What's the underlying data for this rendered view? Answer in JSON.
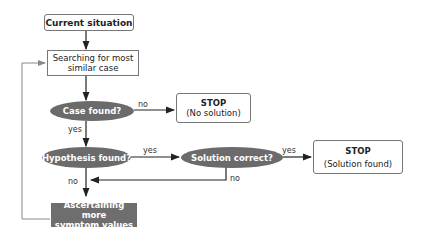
{
  "diagram": {
    "nodes": {
      "start": {
        "label": "Current situation"
      },
      "search": {
        "line1": "Searching for most",
        "line2": "similar case"
      },
      "case_found": {
        "label": "Case found?"
      },
      "stop_no_solution": {
        "title": "STOP",
        "subtitle": "(No solution)"
      },
      "hypothesis_found": {
        "label": "Hypothesis found?"
      },
      "solution_correct": {
        "label": "Solution correct?"
      },
      "stop_solution_found": {
        "title": "STOP",
        "subtitle": "(Solution found)"
      },
      "ascertain": {
        "line1": "Ascertaining more",
        "line2": "symptom values"
      }
    },
    "edge_labels": {
      "case_no": "no",
      "case_yes": "yes",
      "hyp_yes": "yes",
      "hyp_no": "no",
      "sol_yes": "yes",
      "sol_no": "no"
    },
    "colors": {
      "decision_fill": "#6b6b6b",
      "action_fill": "#6e6e6e",
      "line": "#333333",
      "loop_line": "#888888"
    }
  }
}
